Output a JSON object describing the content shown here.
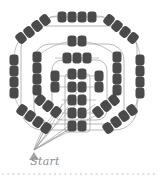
{
  "figure": {
    "type": "seating-map-diagram",
    "background_color": "#ffffff",
    "node_color": "#4a4a4a",
    "edge_color": "#9a9a9a",
    "marker_color": "#a6a6a6",
    "label_color": "#8d8d8d",
    "dot_color": "#d8d8d8",
    "width": 159,
    "height": 180
  },
  "labels": {
    "start": "Start"
  },
  "marker": {
    "name": "start-triangle",
    "x": 34,
    "y": 152
  },
  "chart_data": {
    "type": "scatter",
    "title": "",
    "xlabel": "",
    "ylabel": "",
    "xlim": [
      0,
      159
    ],
    "ylim": [
      0,
      180
    ],
    "grid": false,
    "legend": "none",
    "annotations": [
      {
        "text": "Start",
        "x": 34,
        "y": 164
      }
    ],
    "node_shape": "rounded-rect-pill",
    "node_w": 9,
    "node_h": 11,
    "node_radius": 3.2,
    "groups": [
      {
        "name": "outer-top-row",
        "angle": 0,
        "nodes": [
          {
            "x": 62,
            "y": 17
          },
          {
            "x": 72,
            "y": 17
          },
          {
            "x": 82,
            "y": 17
          },
          {
            "x": 92,
            "y": 17
          }
        ]
      },
      {
        "name": "outer-upper-left-diagonal",
        "angle": -38,
        "nodes": [
          {
            "x": 21,
            "y": 38
          },
          {
            "x": 29,
            "y": 32
          },
          {
            "x": 37,
            "y": 26
          },
          {
            "x": 45,
            "y": 20
          }
        ]
      },
      {
        "name": "outer-upper-right-diagonal",
        "angle": 38,
        "nodes": [
          {
            "x": 109,
            "y": 20
          },
          {
            "x": 117,
            "y": 26
          },
          {
            "x": 125,
            "y": 32
          },
          {
            "x": 133,
            "y": 38
          }
        ]
      },
      {
        "name": "outer-left-column",
        "angle": 0,
        "nodes": [
          {
            "x": 14,
            "y": 60
          },
          {
            "x": 14,
            "y": 71
          },
          {
            "x": 14,
            "y": 82
          },
          {
            "x": 14,
            "y": 93
          }
        ]
      },
      {
        "name": "outer-right-column",
        "angle": 0,
        "nodes": [
          {
            "x": 140,
            "y": 60
          },
          {
            "x": 140,
            "y": 71
          },
          {
            "x": 140,
            "y": 82
          },
          {
            "x": 140,
            "y": 93
          }
        ]
      },
      {
        "name": "outer-lower-left-diagonal",
        "angle": 36,
        "nodes": [
          {
            "x": 22,
            "y": 110
          },
          {
            "x": 30,
            "y": 116
          },
          {
            "x": 38,
            "y": 122
          },
          {
            "x": 46,
            "y": 128
          }
        ]
      },
      {
        "name": "outer-lower-right-diagonal",
        "angle": -36,
        "nodes": [
          {
            "x": 108,
            "y": 128
          },
          {
            "x": 116,
            "y": 122
          },
          {
            "x": 124,
            "y": 116
          },
          {
            "x": 132,
            "y": 110
          }
        ]
      },
      {
        "name": "ring2-top-pair",
        "angle": 0,
        "nodes": [
          {
            "x": 72,
            "y": 41
          },
          {
            "x": 82,
            "y": 41
          }
        ]
      },
      {
        "name": "ring2-left-column",
        "angle": 0,
        "nodes": [
          {
            "x": 37,
            "y": 57
          },
          {
            "x": 37,
            "y": 68
          },
          {
            "x": 37,
            "y": 79
          },
          {
            "x": 37,
            "y": 90
          }
        ]
      },
      {
        "name": "ring2-right-column",
        "angle": 0,
        "nodes": [
          {
            "x": 117,
            "y": 57
          },
          {
            "x": 117,
            "y": 68
          },
          {
            "x": 117,
            "y": 79
          },
          {
            "x": 117,
            "y": 90
          }
        ]
      },
      {
        "name": "ring2-lower-left-diagonal",
        "angle": 38,
        "nodes": [
          {
            "x": 40,
            "y": 100
          },
          {
            "x": 48,
            "y": 106
          },
          {
            "x": 56,
            "y": 112
          }
        ]
      },
      {
        "name": "ring2-lower-right-diagonal",
        "angle": -38,
        "nodes": [
          {
            "x": 98,
            "y": 112
          },
          {
            "x": 106,
            "y": 106
          },
          {
            "x": 114,
            "y": 100
          }
        ]
      },
      {
        "name": "ring3-top-row",
        "angle": 0,
        "nodes": [
          {
            "x": 67,
            "y": 58
          },
          {
            "x": 77,
            "y": 58
          },
          {
            "x": 87,
            "y": 58
          }
        ]
      },
      {
        "name": "ring3-left-column",
        "angle": 0,
        "nodes": [
          {
            "x": 55,
            "y": 76
          },
          {
            "x": 55,
            "y": 87
          }
        ]
      },
      {
        "name": "ring3-right-column",
        "angle": 0,
        "nodes": [
          {
            "x": 99,
            "y": 76
          },
          {
            "x": 99,
            "y": 87
          }
        ]
      },
      {
        "name": "inner-column-pairs",
        "angle": 0,
        "nodes": [
          {
            "x": 72,
            "y": 74
          },
          {
            "x": 82,
            "y": 74
          },
          {
            "x": 72,
            "y": 87
          },
          {
            "x": 82,
            "y": 87
          },
          {
            "x": 72,
            "y": 100
          },
          {
            "x": 82,
            "y": 100
          },
          {
            "x": 72,
            "y": 113
          },
          {
            "x": 82,
            "y": 113
          },
          {
            "x": 72,
            "y": 126
          },
          {
            "x": 82,
            "y": 126
          }
        ]
      }
    ],
    "boundaries": [
      {
        "name": "outer-boundary",
        "x": 21,
        "y": 26,
        "w": 116,
        "h": 104,
        "r": 22
      },
      {
        "name": "ring2-boundary",
        "x": 34,
        "y": 44,
        "w": 90,
        "h": 80,
        "r": 16
      },
      {
        "name": "ring3-boundary",
        "x": 52,
        "y": 60,
        "w": 55,
        "h": 60,
        "r": 10
      },
      {
        "name": "inner-boundary",
        "x": 65,
        "y": 74,
        "w": 25,
        "h": 58,
        "r": 3
      }
    ],
    "dot_row": {
      "name": "bottom-dot-row",
      "y": 174,
      "x_start": 3,
      "spacing": 5.2,
      "count": 30,
      "radius": 1
    }
  }
}
